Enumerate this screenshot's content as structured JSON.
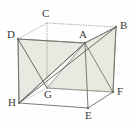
{
  "figure": {
    "name": "cube-with-shaded-triangles",
    "type": "geometric-solid-diagram",
    "background_color": "#fefefe",
    "edge_color": "#6e6e66",
    "hidden_edge_color": "#9a9a92",
    "shade_fill_color": "#e7e8df",
    "shade_stroke_color": "#77776d",
    "diagonal_color": "#5a5a52",
    "label_color": "#3a3a3a"
  },
  "vertices": [
    {
      "id": "A",
      "label": "A",
      "x": 85,
      "y": 43,
      "label_x": 79,
      "label_y": 29,
      "hidden": false
    },
    {
      "id": "B",
      "label": "B",
      "x": 116,
      "y": 27,
      "label_x": 120,
      "label_y": 20,
      "hidden": false
    },
    {
      "id": "C",
      "label": "C",
      "x": 47,
      "y": 23,
      "label_x": 42,
      "label_y": 8,
      "hidden": true
    },
    {
      "id": "D",
      "label": "D",
      "x": 18,
      "y": 39,
      "label_x": 7,
      "label_y": 29,
      "hidden": false
    },
    {
      "id": "E",
      "label": "E",
      "x": 88,
      "y": 108,
      "label_x": 85,
      "label_y": 110,
      "hidden": false
    },
    {
      "id": "F",
      "label": "F",
      "x": 113,
      "y": 92,
      "label_x": 117,
      "label_y": 86,
      "hidden": false
    },
    {
      "id": "G",
      "label": "G",
      "x": 47,
      "y": 88,
      "label_x": 44,
      "label_y": 89,
      "hidden": true
    },
    {
      "id": "H",
      "label": "H",
      "x": 19,
      "y": 103,
      "label_x": 8,
      "label_y": 97,
      "hidden": false
    }
  ],
  "edges": [
    {
      "from": "D",
      "to": "C",
      "hidden": true
    },
    {
      "from": "C",
      "to": "B",
      "hidden": true
    },
    {
      "from": "D",
      "to": "A",
      "hidden": false
    },
    {
      "from": "A",
      "to": "B",
      "hidden": false
    },
    {
      "from": "D",
      "to": "H",
      "hidden": false
    },
    {
      "from": "A",
      "to": "E",
      "hidden": false
    },
    {
      "from": "B",
      "to": "F",
      "hidden": false
    },
    {
      "from": "C",
      "to": "G",
      "hidden": true
    },
    {
      "from": "H",
      "to": "G",
      "hidden": true
    },
    {
      "from": "G",
      "to": "F",
      "hidden": true
    },
    {
      "from": "H",
      "to": "E",
      "hidden": false
    },
    {
      "from": "E",
      "to": "F",
      "hidden": false
    }
  ],
  "diagonals": [
    {
      "from": "H",
      "to": "A",
      "style": "solid"
    },
    {
      "from": "H",
      "to": "B",
      "style": "solid"
    },
    {
      "from": "D",
      "to": "G",
      "style": "solid"
    }
  ],
  "shaded_faces": [
    {
      "name": "triangle-D-A-H",
      "points": "D,A,H"
    },
    {
      "name": "triangle-A-B-F",
      "points": "A,B,F"
    },
    {
      "name": "triangle-A-F-G",
      "points": "A,F,G"
    }
  ],
  "labels": {
    "A": "A",
    "B": "B",
    "C": "C",
    "D": "D",
    "E": "E",
    "F": "F",
    "G": "G",
    "H": "H"
  }
}
